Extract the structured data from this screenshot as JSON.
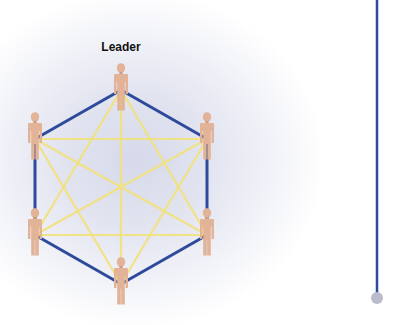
{
  "diagram": {
    "title": "Leader",
    "type": "fully-connected network with leader",
    "colors": {
      "outer_ring": "#2e4a9a",
      "inner_links": "#f2e27a",
      "person": "#e2b396",
      "person_shade": "#d19d80",
      "label": "#111111",
      "timeline_line": "#2e4a9a",
      "timeline_end": "#b9bccb",
      "background_center": "#d6d9ea"
    },
    "nodes": [
      {
        "id": "leader",
        "label": "Leader",
        "x": 121,
        "y": 86
      },
      {
        "id": "upper-right",
        "label": "",
        "x": 207,
        "y": 135
      },
      {
        "id": "lower-right",
        "label": "",
        "x": 207,
        "y": 231
      },
      {
        "id": "bottom",
        "label": "",
        "x": 121,
        "y": 280
      },
      {
        "id": "lower-left",
        "label": "",
        "x": 35,
        "y": 231
      },
      {
        "id": "upper-left",
        "label": "",
        "x": 35,
        "y": 135
      }
    ],
    "ring_edges": [
      [
        0,
        1
      ],
      [
        1,
        2
      ],
      [
        2,
        3
      ],
      [
        3,
        4
      ],
      [
        4,
        5
      ],
      [
        5,
        0
      ]
    ],
    "inner_edges": [
      [
        0,
        2
      ],
      [
        0,
        3
      ],
      [
        0,
        4
      ],
      [
        1,
        3
      ],
      [
        1,
        4
      ],
      [
        1,
        5
      ],
      [
        2,
        4
      ],
      [
        2,
        5
      ],
      [
        3,
        5
      ]
    ],
    "side_line": {
      "x": 377,
      "y_top": 0,
      "y_bottom": 293,
      "end_circle": {
        "cx": 377,
        "cy": 298,
        "r": 6
      }
    }
  }
}
